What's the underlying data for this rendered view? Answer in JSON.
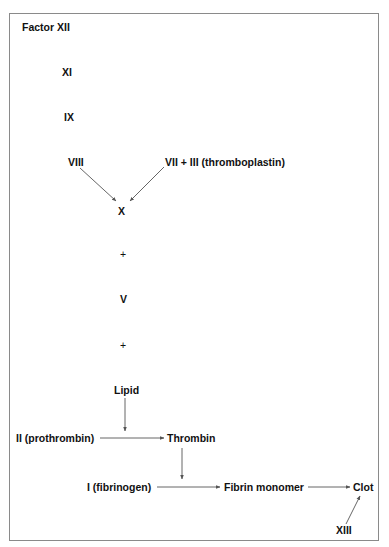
{
  "diagram": {
    "nodes": {
      "factor_xii": "Factor XII",
      "xi": "XI",
      "ix": "IX",
      "viii": "VIII",
      "vii_iii": "VII + III (thromboplastin)",
      "x": "X",
      "plus1": "+",
      "v": "V",
      "plus2": "+",
      "lipid": "Lipid",
      "prothrombin": "II (prothrombin)",
      "thrombin": "Thrombin",
      "fibrinogen": "I (fibrinogen)",
      "fibrin_monomer": "Fibrin monomer",
      "clot": "Clot",
      "xiii": "XIII"
    },
    "edges": [
      {
        "from": "VIII",
        "to": "X"
      },
      {
        "from": "VII + III (thromboplastin)",
        "to": "X"
      },
      {
        "from": "Lipid",
        "to": "prothrombin-thrombin arrow"
      },
      {
        "from": "II (prothrombin)",
        "to": "Thrombin"
      },
      {
        "from": "Thrombin",
        "to": "fibrinogen-fibrin arrow"
      },
      {
        "from": "I (fibrinogen)",
        "to": "Fibrin monomer"
      },
      {
        "from": "Fibrin monomer",
        "to": "Clot"
      },
      {
        "from": "XIII",
        "to": "Clot"
      }
    ],
    "colors": {
      "text": "#111111",
      "arrow": "#555555",
      "border": "#8a8a8a"
    }
  }
}
